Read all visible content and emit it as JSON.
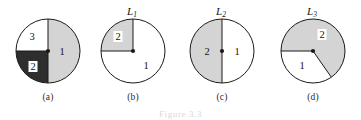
{
  "figure": {
    "caption": "Figure 3.3",
    "background_color": "#ffffff",
    "stroke_color": "#1a1a1a",
    "gray_fill": "#d4d4d4",
    "dark_fill": "#2e2e2e",
    "white_fill": "#ffffff"
  },
  "panels": [
    {
      "id": "a",
      "caption": "(a)",
      "center_x": 48,
      "center_y": 51,
      "radius": 32,
      "top_label": "",
      "regions": [
        {
          "label": "1",
          "fill": "gray",
          "start_deg": -90,
          "end_deg": 90,
          "label_x": 62,
          "label_y": 52,
          "boxed": false
        },
        {
          "label": "3",
          "fill": "white",
          "start_deg": 90,
          "end_deg": 180,
          "label_x": 32,
          "label_y": 37,
          "boxed": false
        },
        {
          "label": "2",
          "fill": "dark",
          "start_deg": 180,
          "end_deg": 270,
          "label_x": 33,
          "label_y": 67,
          "boxed": true
        }
      ]
    },
    {
      "id": "b",
      "caption": "(b)",
      "center_x": 133,
      "center_y": 51,
      "radius": 32,
      "top_label": "L1",
      "top_label_base": "L",
      "top_label_sub": "1",
      "regions": [
        {
          "label": "2",
          "fill": "gray",
          "start_deg": 90,
          "end_deg": 180,
          "label_x": 118,
          "label_y": 37,
          "boxed": true
        },
        {
          "label": "1",
          "fill": "white",
          "start_deg": 180,
          "end_deg": 450,
          "label_x": 146,
          "label_y": 66,
          "boxed": false
        }
      ]
    },
    {
      "id": "c",
      "caption": "(c)",
      "center_x": 222,
      "center_y": 51,
      "radius": 32,
      "top_label": "L2",
      "top_label_base": "L",
      "top_label_sub": "2",
      "regions": [
        {
          "label": "2",
          "fill": "gray",
          "start_deg": 90,
          "end_deg": 270,
          "label_x": 207,
          "label_y": 52,
          "boxed": false
        },
        {
          "label": "1",
          "fill": "white",
          "start_deg": 270,
          "end_deg": 450,
          "label_x": 237,
          "label_y": 52,
          "boxed": false
        }
      ]
    },
    {
      "id": "d",
      "caption": "(d)",
      "center_x": 313,
      "center_y": 51,
      "radius": 32,
      "top_label": "L3",
      "top_label_base": "L",
      "top_label_sub": "3",
      "regions": [
        {
          "label": "2",
          "fill": "gray",
          "start_deg": -55,
          "end_deg": 180,
          "label_x": 322,
          "label_y": 35,
          "boxed": true
        },
        {
          "label": "1",
          "fill": "white",
          "start_deg": 180,
          "end_deg": 305,
          "label_x": 302,
          "label_y": 66,
          "boxed": false
        }
      ]
    }
  ]
}
